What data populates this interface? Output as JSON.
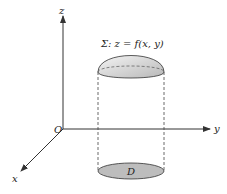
{
  "diagram": {
    "axes": {
      "z_label": "z",
      "y_label": "y",
      "x_label": "x",
      "origin_label": "O"
    },
    "surface_label": "Σ: z = f(x, y)",
    "region_label": "D",
    "colors": {
      "axis": "#333333",
      "surface_fill": "#d9d9d9",
      "region_fill": "#bdbdbd",
      "dashed": "#444444"
    }
  }
}
